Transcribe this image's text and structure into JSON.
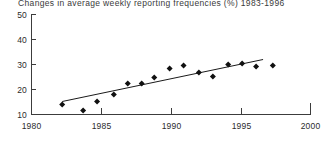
{
  "chart_data": {
    "type": "scatter",
    "title": "Changes in average weekly reporting frequencies (%) 1983-1996",
    "xlabel": "",
    "ylabel": "",
    "xlim": [
      1980,
      2000
    ],
    "ylim": [
      10,
      50
    ],
    "grid": false,
    "legend": null,
    "x_ticks": [
      1980,
      1985,
      1990,
      1995,
      2000
    ],
    "x_tick_labels": [
      "1980",
      "1985",
      "1990",
      "1995",
      "2000"
    ],
    "y_ticks": [
      10,
      20,
      30,
      40,
      50
    ],
    "y_tick_labels": [
      "10",
      "20",
      "30",
      "40",
      "50"
    ],
    "series": [
      {
        "name": "Average weekly reporting frequency",
        "marker": "filled-diamond",
        "x": [
          1982.2,
          1983.7,
          1984.7,
          1985.9,
          1986.9,
          1987.9,
          1988.8,
          1989.9,
          1990.9,
          1992.0,
          1993.0,
          1994.1,
          1995.1,
          1996.1,
          1997.3
        ],
        "values": [
          14.0,
          11.6,
          15.2,
          18.0,
          22.4,
          22.4,
          24.8,
          28.4,
          29.6,
          26.8,
          25.2,
          30.0,
          30.4,
          29.2,
          29.6
        ]
      },
      {
        "name": "Linear trend",
        "type": "line",
        "x": [
          1982.2,
          1996.6
        ],
        "values": [
          15.2,
          32.0
        ]
      }
    ]
  },
  "colors": {
    "marker": "#111111",
    "trend": "#1a1a1a",
    "axis": "#3c3c3c",
    "title": "#3a3a3a",
    "background": "#ffffff"
  }
}
